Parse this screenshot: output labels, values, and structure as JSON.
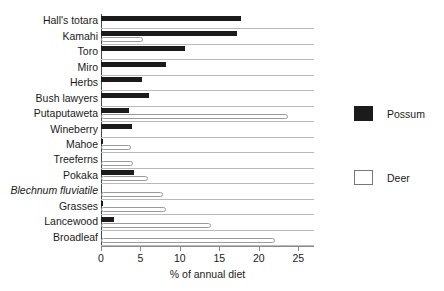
{
  "chart_data": {
    "type": "bar",
    "orientation": "horizontal",
    "title": "",
    "xlabel": "% of annual diet",
    "ylabel": "",
    "xlim": [
      0,
      27
    ],
    "xticks": [
      0,
      5,
      10,
      15,
      20,
      25
    ],
    "xtick_labels": [
      "0",
      "5",
      "10",
      "15",
      "20",
      "25"
    ],
    "grid": false,
    "legend_position": "right",
    "categories": [
      "Hall's totara",
      "Kamahi",
      "Toro",
      "Miro",
      "Herbs",
      "Bush lawyers",
      "Putaputaweta",
      "Wineberry",
      "Mahoe",
      "Treeferns",
      "Pokaka",
      "Blechnum fluviatile",
      "Grasses",
      "Lancewood",
      "Broadleaf"
    ],
    "categories_italic": [
      false,
      false,
      false,
      false,
      false,
      false,
      false,
      false,
      false,
      false,
      false,
      true,
      false,
      false,
      false
    ],
    "series": [
      {
        "name": "Possum",
        "color": "#1b1b1b",
        "values": [
          17.8,
          17.3,
          10.6,
          8.3,
          5.2,
          6.1,
          3.5,
          3.9,
          0.3,
          0.0,
          4.2,
          0.0,
          0.3,
          1.7,
          0.0
        ]
      },
      {
        "name": "Deer",
        "color": "#ffffff",
        "values": [
          0.0,
          5.3,
          0.0,
          0.0,
          0.0,
          0.0,
          23.7,
          0.0,
          3.8,
          4.0,
          5.9,
          7.9,
          8.2,
          14.0,
          22.0
        ]
      }
    ]
  },
  "legend": {
    "items": [
      {
        "label": "Possum",
        "style": "filled"
      },
      {
        "label": "Deer",
        "style": "hollow"
      }
    ]
  },
  "axis": {
    "x_title": "% of annual diet"
  }
}
